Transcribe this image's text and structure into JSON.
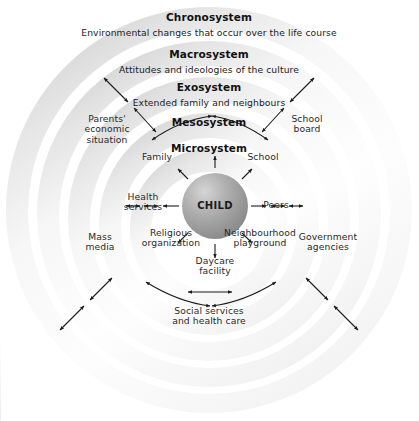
{
  "diagram": {
    "center": {
      "label": "CHILD"
    },
    "rings": [
      {
        "name": "chronosystem",
        "title": "Chronosystem",
        "subtitle": "Environmental changes that occur over the life course"
      },
      {
        "name": "macrosystem",
        "title": "Macrosystem",
        "subtitle": "Attitudes and ideologies of the culture"
      },
      {
        "name": "exosystem",
        "title": "Exosystem",
        "subtitle": "Extended family and neighbours"
      },
      {
        "name": "mesosystem",
        "title": "Mesosystem",
        "subtitle": ""
      },
      {
        "name": "microsystem",
        "title": "Microsystem",
        "subtitle": ""
      }
    ],
    "microsystem_nodes": [
      {
        "name": "family",
        "label": "Family"
      },
      {
        "name": "school",
        "label": "School"
      },
      {
        "name": "health-services",
        "label": "Health\nservices"
      },
      {
        "name": "peers",
        "label": "Peers"
      },
      {
        "name": "religious-organization",
        "label": "Religious\norganization"
      },
      {
        "name": "neighbourhood-playground",
        "label": "Neighbourhood\nplayground"
      },
      {
        "name": "daycare-facility",
        "label": "Daycare\nfacility"
      }
    ],
    "exosystem_nodes": [
      {
        "name": "parents-economic-situation",
        "label": "Parents'\neconomic\nsituation"
      },
      {
        "name": "school-board",
        "label": "School\nboard"
      },
      {
        "name": "mass-media",
        "label": "Mass\nmedia"
      },
      {
        "name": "government-agencies",
        "label": "Government\nagencies"
      },
      {
        "name": "social-services-health-care",
        "label": "Social services\nand health care"
      }
    ],
    "colors": {
      "ring_shade": "#d9d9d9",
      "ring_light": "#ffffff",
      "child_fill": "#9a9a9a",
      "arrow": "#1b1b1b",
      "text": "#2b2b2b",
      "border": "#d8d8d8"
    }
  }
}
